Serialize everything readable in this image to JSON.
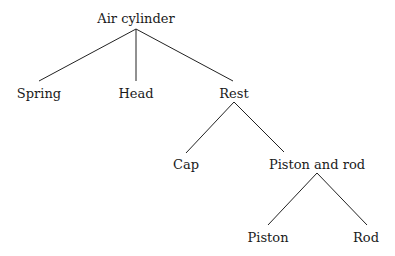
{
  "diagram": {
    "type": "tree",
    "title": "",
    "colors": {
      "line": "#222222",
      "text": "#1a1a1a",
      "background": "#ffffff"
    },
    "nodes": [
      {
        "id": "air-cylinder",
        "label": "Air cylinder",
        "x": 136,
        "y": 18,
        "parent": null
      },
      {
        "id": "spring",
        "label": "Spring",
        "x": 39,
        "y": 93,
        "parent": "air-cylinder"
      },
      {
        "id": "head",
        "label": "Head",
        "x": 136,
        "y": 93,
        "parent": "air-cylinder"
      },
      {
        "id": "rest",
        "label": "Rest",
        "x": 234,
        "y": 93,
        "parent": "air-cylinder"
      },
      {
        "id": "cap",
        "label": "Cap",
        "x": 186,
        "y": 164,
        "parent": "rest"
      },
      {
        "id": "piston-and-rod",
        "label": "Piston and rod",
        "x": 317,
        "y": 164,
        "parent": "rest"
      },
      {
        "id": "piston",
        "label": "Piston",
        "x": 268,
        "y": 237,
        "parent": "piston-and-rod"
      },
      {
        "id": "rod",
        "label": "Rod",
        "x": 366,
        "y": 237,
        "parent": "piston-and-rod"
      }
    ],
    "edges": [
      {
        "from": "air-cylinder",
        "to": "spring",
        "x1": 136,
        "y1": 29,
        "x2": 39,
        "y2": 81
      },
      {
        "from": "air-cylinder",
        "to": "head",
        "x1": 136,
        "y1": 29,
        "x2": 136,
        "y2": 81
      },
      {
        "from": "air-cylinder",
        "to": "rest",
        "x1": 136,
        "y1": 29,
        "x2": 233,
        "y2": 81
      },
      {
        "from": "rest",
        "to": "cap",
        "x1": 234,
        "y1": 102,
        "x2": 186,
        "y2": 153
      },
      {
        "from": "rest",
        "to": "piston-and-rod",
        "x1": 234,
        "y1": 102,
        "x2": 284,
        "y2": 152
      },
      {
        "from": "piston-and-rod",
        "to": "piston",
        "x1": 317,
        "y1": 173,
        "x2": 268,
        "y2": 225
      },
      {
        "from": "piston-and-rod",
        "to": "rod",
        "x1": 317,
        "y1": 173,
        "x2": 367,
        "y2": 225
      }
    ]
  }
}
